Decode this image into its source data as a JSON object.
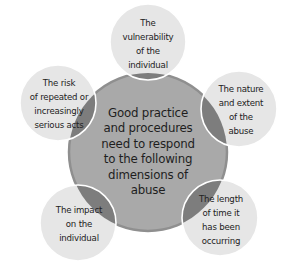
{
  "diagram": {
    "type": "radial-cluster",
    "center": {
      "label": "Good practice and procedures need to respond to the following dimensions of abuse",
      "lines": [
        "Good practice",
        "and procedures",
        "need to respond",
        "to the following",
        "dimensions of",
        "abuse"
      ]
    },
    "nodes": [
      {
        "id": "top",
        "label": "The vulnerability of the individual",
        "lines": [
          "The",
          "vulnerability",
          "of the",
          "individual"
        ]
      },
      {
        "id": "right",
        "label": "The nature and extent of the abuse",
        "lines": [
          "The nature",
          "and extent",
          "of the",
          "abuse"
        ]
      },
      {
        "id": "bottom-right",
        "label": "The length of time it has been occurring",
        "lines": [
          "The length",
          "of time it",
          "has been",
          "occurring"
        ]
      },
      {
        "id": "bottom-left",
        "label": "The impact on the individual",
        "lines": [
          "The impact",
          "on the",
          "individual"
        ]
      },
      {
        "id": "left",
        "label": "The risk of repeated or increasingly serious acts",
        "lines": [
          "The risk",
          "of repeated or",
          "increasingly",
          "serious acts"
        ]
      }
    ],
    "colors": {
      "center_fill": "#a9a9a9",
      "center_rim": "#8f8f8f",
      "node_fill": "#e6e6e6",
      "overlap_fill": "#7d7d7d",
      "stroke": "#ffffff",
      "text": "#222222"
    }
  }
}
